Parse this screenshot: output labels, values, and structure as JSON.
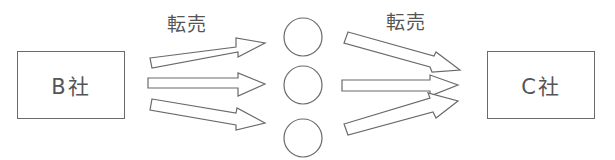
{
  "diagram": {
    "type": "flow",
    "nodes": [
      {
        "id": "b",
        "label": "B社"
      },
      {
        "id": "mid1",
        "label": ""
      },
      {
        "id": "mid2",
        "label": ""
      },
      {
        "id": "mid3",
        "label": ""
      },
      {
        "id": "c",
        "label": "C社"
      }
    ],
    "edge_labels": {
      "left": "転売",
      "right": "転売"
    },
    "edges": [
      {
        "from": "b",
        "to": "mid1",
        "label": "転売"
      },
      {
        "from": "b",
        "to": "mid2"
      },
      {
        "from": "b",
        "to": "mid3"
      },
      {
        "from": "mid1",
        "to": "c",
        "label": "転売"
      },
      {
        "from": "mid2",
        "to": "c"
      },
      {
        "from": "mid3",
        "to": "c"
      }
    ],
    "colors": {
      "stroke": "#6a6a6a",
      "text": "#555555",
      "background": "#ffffff"
    }
  }
}
